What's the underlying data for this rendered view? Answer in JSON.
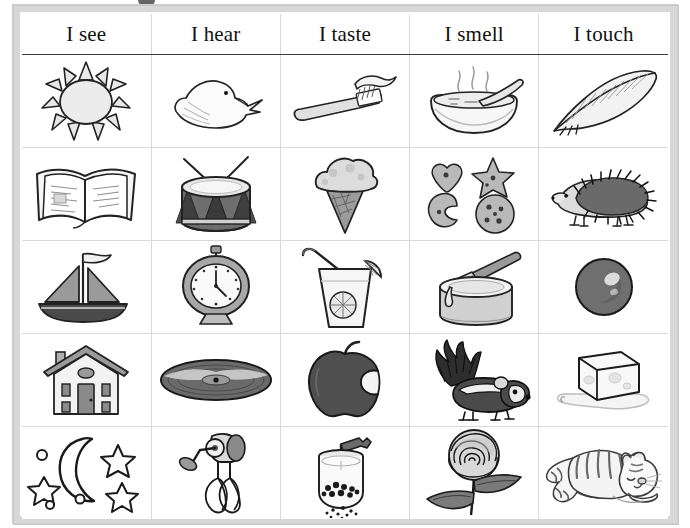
{
  "page": {
    "frame_color": "#d7d7d7",
    "grid_line_color": "#d9d9d9",
    "header_rule_color": "#3a3a3a",
    "ink_color": "#1a1a1a",
    "background": "#ffffff",
    "top_mark": "binding-hole-mark"
  },
  "columns": [
    {
      "id": "see",
      "header": "I see"
    },
    {
      "id": "hear",
      "header": "I hear"
    },
    {
      "id": "taste",
      "header": "I taste"
    },
    {
      "id": "smell",
      "header": "I smell"
    },
    {
      "id": "touch",
      "header": "I touch"
    }
  ],
  "rows": [
    {
      "index": 1,
      "cells": [
        {
          "column": "see",
          "icon": "sun-icon",
          "label": "sun"
        },
        {
          "column": "hear",
          "icon": "duck-icon",
          "label": "duck"
        },
        {
          "column": "taste",
          "icon": "toothbrush-icon",
          "label": "toothbrush with toothpaste"
        },
        {
          "column": "smell",
          "icon": "soup-bowl-icon",
          "label": "steaming bowl of soup with spoon"
        },
        {
          "column": "touch",
          "icon": "feather-icon",
          "label": "feather"
        }
      ]
    },
    {
      "index": 2,
      "cells": [
        {
          "column": "see",
          "icon": "open-book-icon",
          "label": "open book"
        },
        {
          "column": "hear",
          "icon": "drum-icon",
          "label": "drum with drumsticks"
        },
        {
          "column": "taste",
          "icon": "ice-cream-icon",
          "label": "ice cream cone"
        },
        {
          "column": "smell",
          "icon": "cookies-icon",
          "label": "cookies: heart, star, moon, round"
        },
        {
          "column": "touch",
          "icon": "hedgehog-icon",
          "label": "hedgehog"
        }
      ]
    },
    {
      "index": 3,
      "cells": [
        {
          "column": "see",
          "icon": "sailboat-icon",
          "label": "sailboat with flag"
        },
        {
          "column": "hear",
          "icon": "clock-icon",
          "label": "alarm clock"
        },
        {
          "column": "taste",
          "icon": "lemonade-icon",
          "label": "glass of lemonade with straw and lemon slice"
        },
        {
          "column": "smell",
          "icon": "paint-can-icon",
          "label": "open paint can with brush"
        },
        {
          "column": "touch",
          "icon": "ball-icon",
          "label": "ball"
        }
      ]
    },
    {
      "index": 4,
      "cells": [
        {
          "column": "see",
          "icon": "house-icon",
          "label": "house with chimney"
        },
        {
          "column": "hear",
          "icon": "vinyl-record-icon",
          "label": "vinyl record"
        },
        {
          "column": "taste",
          "icon": "bitten-apple-icon",
          "label": "apple with a bite taken out"
        },
        {
          "column": "smell",
          "icon": "skunk-icon",
          "label": "skunk"
        },
        {
          "column": "touch",
          "icon": "ice-cube-icon",
          "label": "melting ice cube"
        }
      ]
    },
    {
      "index": 5,
      "cells": [
        {
          "column": "see",
          "icon": "moon-stars-icon",
          "label": "crescent moon and stars"
        },
        {
          "column": "hear",
          "icon": "hand-mixer-icon",
          "label": "hand egg beater"
        },
        {
          "column": "taste",
          "icon": "pepper-grinder-icon",
          "label": "pepper grinder with peppercorns"
        },
        {
          "column": "smell",
          "icon": "rose-icon",
          "label": "rose with leaves"
        },
        {
          "column": "touch",
          "icon": "cat-icon",
          "label": "resting tabby cat"
        }
      ]
    }
  ]
}
